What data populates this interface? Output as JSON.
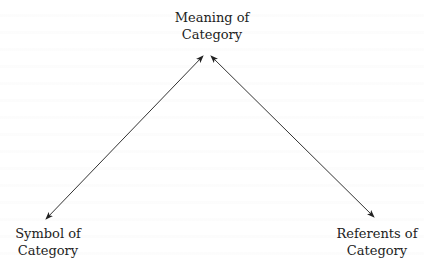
{
  "diagram": {
    "type": "semiotic-triangle",
    "nodes": {
      "meaning": {
        "line1": "Meaning of",
        "line2": "Category"
      },
      "symbol": {
        "line1": "Symbol of",
        "line2": "Category"
      },
      "referents": {
        "line1": "Referents of",
        "line2": "Category"
      }
    },
    "edges": [
      {
        "from": "symbol",
        "to": "meaning",
        "style": "double-arrow"
      },
      {
        "from": "referents",
        "to": "meaning",
        "style": "double-arrow"
      }
    ],
    "colors": {
      "line": "#333333",
      "text": "#222222",
      "background": "#ffffff"
    }
  }
}
